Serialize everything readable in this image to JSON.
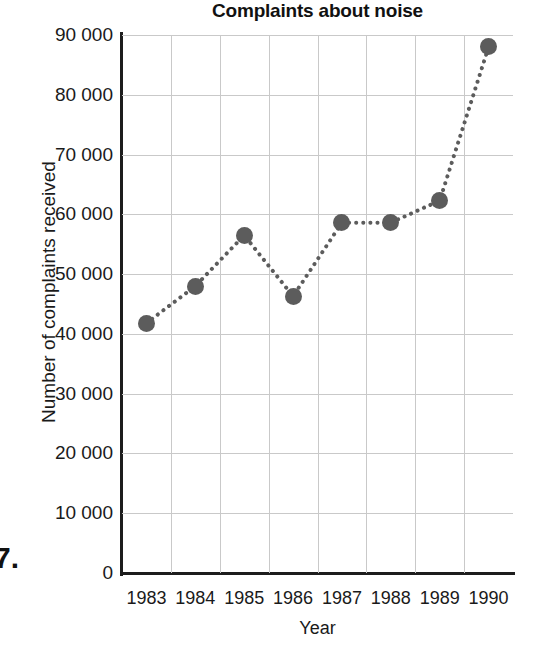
{
  "question_number": "7.",
  "chart_data": {
    "type": "line",
    "title": "Complaints about noise",
    "xlabel": "Year",
    "ylabel": "Number of complaints received",
    "categories": [
      "1983",
      "1984",
      "1985",
      "1986",
      "1987",
      "1988",
      "1989",
      "1990"
    ],
    "x": [
      1983,
      1984,
      1985,
      1986,
      1987,
      1988,
      1989,
      1990
    ],
    "values": [
      41800,
      48000,
      56500,
      46300,
      58600,
      58600,
      62300,
      88000
    ],
    "series": [
      {
        "name": "Number of complaints received",
        "values": [
          41800,
          48000,
          56500,
          46300,
          58600,
          58600,
          62300,
          88000
        ]
      }
    ],
    "ylim": [
      0,
      90000
    ],
    "ytick_labels": [
      "0",
      "10 000",
      "20 000",
      "30 000",
      "40 000",
      "50 000",
      "60 000",
      "70 000",
      "80 000",
      "90 000"
    ],
    "ytick_values": [
      0,
      10000,
      20000,
      30000,
      40000,
      50000,
      60000,
      70000,
      80000,
      90000
    ],
    "xtick_labels": [
      "1983",
      "1984",
      "1985",
      "1986",
      "1987",
      "1988",
      "1989",
      "1990"
    ],
    "grid": true,
    "legend": "none",
    "line_style": "dotted",
    "marker": "circle",
    "marker_color": "#5c5c5c",
    "line_color": "#5c5c5c",
    "grid_color": "#c9c9c9",
    "axis_color": "#1d1d1d",
    "background_color": "#ffffff"
  }
}
